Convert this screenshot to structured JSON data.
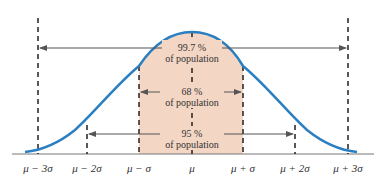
{
  "colors": {
    "curve": "#2a7fc2",
    "shade": "#f3d6c4",
    "dashed": "#222222",
    "arrow": "#555555",
    "baseline": "#777777",
    "text": "#333333"
  },
  "labels": {
    "band_997": {
      "percent": "99.7 %",
      "caption": "of population"
    },
    "band_68": {
      "percent": "68 %",
      "caption": "of population"
    },
    "band_95": {
      "percent": "95 %",
      "caption": "of population"
    }
  },
  "axis": {
    "ticks": [
      {
        "label": "μ − 3σ"
      },
      {
        "label": "μ − 2σ"
      },
      {
        "label": "μ − σ"
      },
      {
        "label": "μ"
      },
      {
        "label": "μ + σ"
      },
      {
        "label": "μ + 2σ"
      },
      {
        "label": "μ + 3σ"
      }
    ]
  }
}
